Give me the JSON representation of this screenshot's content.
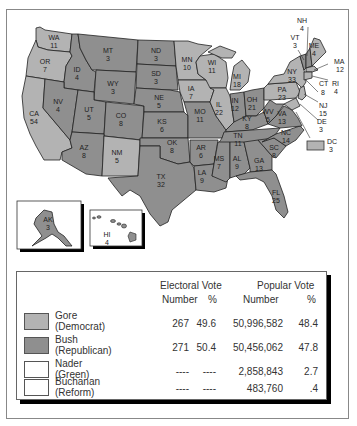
{
  "colors": {
    "democrat": "#b3b3b3",
    "republican": "#8f8f8f",
    "none": "#ffffff"
  },
  "states": {
    "WA": {
      "abbr": "WA",
      "ev": "11"
    },
    "OR": {
      "abbr": "OR",
      "ev": "7"
    },
    "CA": {
      "abbr": "CA",
      "ev": "54"
    },
    "ID": {
      "abbr": "ID",
      "ev": "4"
    },
    "NV": {
      "abbr": "NV",
      "ev": "4"
    },
    "MT": {
      "abbr": "MT",
      "ev": "3"
    },
    "WY": {
      "abbr": "WY",
      "ev": "3"
    },
    "UT": {
      "abbr": "UT",
      "ev": "5"
    },
    "CO": {
      "abbr": "CO",
      "ev": "8"
    },
    "AZ": {
      "abbr": "AZ",
      "ev": "8"
    },
    "NM": {
      "abbr": "NM",
      "ev": "5"
    },
    "ND": {
      "abbr": "ND",
      "ev": "3"
    },
    "SD": {
      "abbr": "SD",
      "ev": "3"
    },
    "NE": {
      "abbr": "NE",
      "ev": "5"
    },
    "KS": {
      "abbr": "KS",
      "ev": "6"
    },
    "OK": {
      "abbr": "OK",
      "ev": "8"
    },
    "TX": {
      "abbr": "TX",
      "ev": "32"
    },
    "MN": {
      "abbr": "MN",
      "ev": "10"
    },
    "IA": {
      "abbr": "IA",
      "ev": "7"
    },
    "MO": {
      "abbr": "MO",
      "ev": "11"
    },
    "AR": {
      "abbr": "AR",
      "ev": "6"
    },
    "LA": {
      "abbr": "LA",
      "ev": "9"
    },
    "WI": {
      "abbr": "WI",
      "ev": "11"
    },
    "IL": {
      "abbr": "IL",
      "ev": "22"
    },
    "MI": {
      "abbr": "MI",
      "ev": "18"
    },
    "IN": {
      "abbr": "IN",
      "ev": "12"
    },
    "OH": {
      "abbr": "OH",
      "ev": "21"
    },
    "KY": {
      "abbr": "KY",
      "ev": "8"
    },
    "TN": {
      "abbr": "TN",
      "ev": "11"
    },
    "MS": {
      "abbr": "MS",
      "ev": "7"
    },
    "AL": {
      "abbr": "AL",
      "ev": "9"
    },
    "GA": {
      "abbr": "GA",
      "ev": "13"
    },
    "FL": {
      "abbr": "FL",
      "ev": "25"
    },
    "SC": {
      "abbr": "SC",
      "ev": "8"
    },
    "NC": {
      "abbr": "NC",
      "ev": "14"
    },
    "VA": {
      "abbr": "VA",
      "ev": "13"
    },
    "WV": {
      "abbr": "WV",
      "ev": "5"
    },
    "PA": {
      "abbr": "PA",
      "ev": "23"
    },
    "NY": {
      "abbr": "NY",
      "ev": "33"
    },
    "VT": {
      "abbr": "VT",
      "ev": "3"
    },
    "NH": {
      "abbr": "NH",
      "ev": "4"
    },
    "ME": {
      "abbr": "ME",
      "ev": "4"
    },
    "MA": {
      "abbr": "MA",
      "ev": "12"
    },
    "RI": {
      "abbr": "RI",
      "ev": "4"
    },
    "CT": {
      "abbr": "CT",
      "ev": "8"
    },
    "NJ": {
      "abbr": "NJ",
      "ev": "15"
    },
    "DE": {
      "abbr": "DE",
      "ev": "3"
    },
    "DC": {
      "abbr": "DC",
      "ev": "3"
    },
    "AK": {
      "abbr": "AK",
      "ev": "3"
    },
    "HI": {
      "abbr": "HI",
      "ev": "4"
    }
  },
  "legend": {
    "headers": {
      "electoral": "Electoral Vote",
      "popular": "Popular Vote",
      "number": "Number",
      "percent": "%"
    },
    "rows": [
      {
        "name": "Gore",
        "party": "(Democrat)",
        "ev_number": "267",
        "ev_percent": "49.6",
        "pop_number": "50,996,582",
        "pop_percent": "48.4"
      },
      {
        "name": "Bush",
        "party": "(Republican)",
        "ev_number": "271",
        "ev_percent": "50.4",
        "pop_number": "50,456,062",
        "pop_percent": "47.8"
      },
      {
        "name": "Nader",
        "party": "(Green)",
        "ev_number": "----",
        "ev_percent": "----",
        "pop_number": "2,858,843",
        "pop_percent": "2.7"
      },
      {
        "name": "Buchanan",
        "party": "(Reform)",
        "ev_number": "----",
        "ev_percent": "----",
        "pop_number": "483,760",
        "pop_percent": ".4"
      }
    ]
  }
}
